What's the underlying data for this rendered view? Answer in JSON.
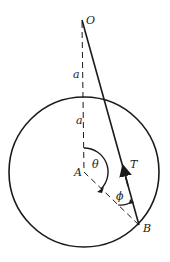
{
  "diagram": {
    "labels": {
      "O": "O",
      "A": "A",
      "B": "B",
      "T": "T",
      "a_upper": "a",
      "a_lower": "a",
      "theta": "θ",
      "phi": "ϕ"
    },
    "colors": {
      "stroke": "#1a1a1a",
      "background": "#ffffff"
    }
  }
}
